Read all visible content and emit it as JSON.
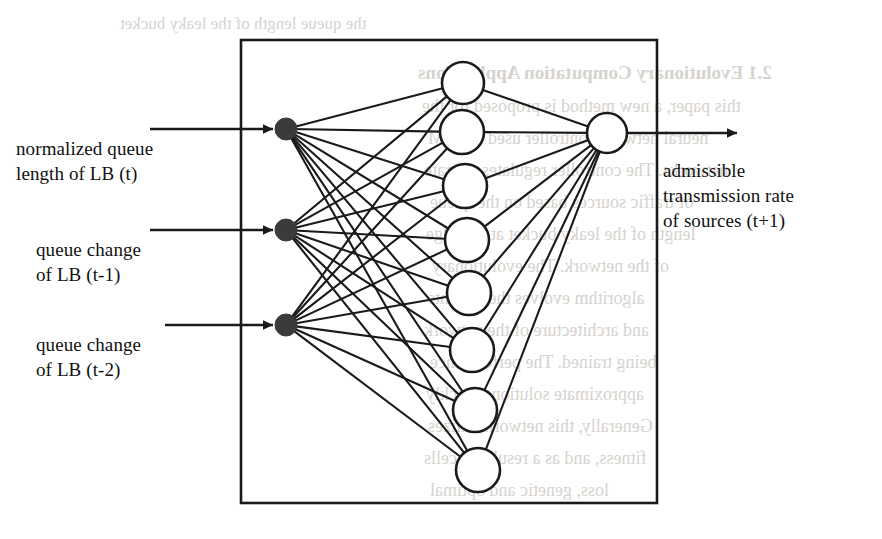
{
  "figure": {
    "box": {
      "x": 241,
      "y": 40,
      "width": 416,
      "height": 463
    },
    "colors": {
      "stroke": "#1a1a1a",
      "input_node_fill": "#3b3b3b",
      "hidden_node_fill": "#ffffff",
      "background": "#ffffff",
      "ghost_text": "#d0ccc7"
    },
    "inputs": [
      {
        "id": "input-1",
        "label": "normalized queue\nlength of LB (t)",
        "cx": 286,
        "cy": 129,
        "r": 11,
        "arrow_start_x": 150,
        "label_x": 16,
        "label_y": 136
      },
      {
        "id": "input-2",
        "label": "queue change\nof LB (t-1)",
        "cx": 286,
        "cy": 230,
        "r": 11,
        "arrow_start_x": 150,
        "label_x": 36,
        "label_y": 237
      },
      {
        "id": "input-3",
        "label": "queue change\nof LB (t-2)",
        "cx": 286,
        "cy": 325,
        "r": 11,
        "arrow_start_x": 165,
        "label_x": 36,
        "label_y": 332
      }
    ],
    "hidden_nodes": [
      {
        "id": "hidden-1",
        "cx": 463,
        "cy": 83,
        "r": 21
      },
      {
        "id": "hidden-2",
        "cx": 462,
        "cy": 132,
        "r": 22
      },
      {
        "id": "hidden-3",
        "cx": 465,
        "cy": 186,
        "r": 22
      },
      {
        "id": "hidden-4",
        "cx": 467,
        "cy": 240,
        "r": 22
      },
      {
        "id": "hidden-5",
        "cx": 469,
        "cy": 293,
        "r": 22
      },
      {
        "id": "hidden-6",
        "cx": 472,
        "cy": 350,
        "r": 22
      },
      {
        "id": "hidden-7",
        "cx": 475,
        "cy": 410,
        "r": 22
      },
      {
        "id": "hidden-8",
        "cx": 478,
        "cy": 470,
        "r": 22
      }
    ],
    "output_node": {
      "id": "output-1",
      "cx": 607,
      "cy": 133,
      "r": 20
    },
    "output": {
      "label": "admissible\ntransmission rate\nof sources (t+1)",
      "arrow_end_x": 737,
      "label_x": 663,
      "label_y": 158
    }
  },
  "ghost_text": [
    {
      "text": "2.1   Evolutionary Computation Applications",
      "x": 418,
      "y": 62,
      "size": 19,
      "weight": "bold"
    },
    {
      "text": "this paper, a new method is proposed for the",
      "x": 422,
      "y": 96,
      "size": 18,
      "weight": "normal"
    },
    {
      "text": "neural network controller used in ATM",
      "x": 428,
      "y": 128,
      "size": 18,
      "weight": "normal"
    },
    {
      "text": "networks. The controller regulates the rate",
      "x": 424,
      "y": 160,
      "size": 18,
      "weight": "normal"
    },
    {
      "text": "of traffic sources based on the queue",
      "x": 430,
      "y": 192,
      "size": 18,
      "weight": "normal"
    },
    {
      "text": "length of the leaky bucket at the edge",
      "x": 426,
      "y": 224,
      "size": 18,
      "weight": "normal"
    },
    {
      "text": "of the network. The evolutionary",
      "x": 432,
      "y": 256,
      "size": 18,
      "weight": "normal"
    },
    {
      "text": "algorithm evolves the weights",
      "x": 428,
      "y": 288,
      "size": 18,
      "weight": "normal"
    },
    {
      "text": "and architecture of the network",
      "x": 424,
      "y": 320,
      "size": 18,
      "weight": "normal"
    },
    {
      "text": "being trained. The performance",
      "x": 430,
      "y": 352,
      "size": 18,
      "weight": "normal"
    },
    {
      "text": "approximate solutions quickly",
      "x": 426,
      "y": 384,
      "size": 18,
      "weight": "normal"
    },
    {
      "text": "Generally, this network utilizes",
      "x": 428,
      "y": 416,
      "size": 18,
      "weight": "normal"
    },
    {
      "text": "fitness, and as a result the cells",
      "x": 424,
      "y": 448,
      "size": 18,
      "weight": "normal"
    },
    {
      "text": "loss, genetic and optimal",
      "x": 430,
      "y": 480,
      "size": 18,
      "weight": "normal"
    },
    {
      "text": "the queue length of the leaky bucket",
      "x": 120,
      "y": 14,
      "size": 17,
      "weight": "normal"
    }
  ]
}
